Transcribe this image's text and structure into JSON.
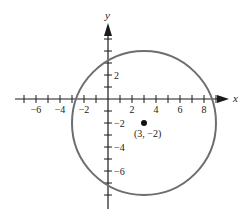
{
  "diagram": {
    "type": "coordinate-plane-circle",
    "axes": {
      "x_label": "x",
      "y_label": "y",
      "x_range": [
        -7,
        9
      ],
      "y_range": [
        -8,
        5
      ],
      "x_tick_labels": [
        {
          "value": -6,
          "text": "−6"
        },
        {
          "value": -4,
          "text": "−4"
        },
        {
          "value": -2,
          "text": "−2"
        },
        {
          "value": 2,
          "text": "2"
        },
        {
          "value": 4,
          "text": "4"
        },
        {
          "value": 6,
          "text": "6"
        },
        {
          "value": 8,
          "text": "8"
        }
      ],
      "y_tick_labels": [
        {
          "value": 2,
          "text": "2"
        },
        {
          "value": -2,
          "text": "−2"
        },
        {
          "value": -4,
          "text": "−4"
        },
        {
          "value": -6,
          "text": "−6"
        }
      ]
    },
    "circle": {
      "center": [
        3,
        -2
      ],
      "radius": 6,
      "stroke_color": "#6e6e6e"
    },
    "center_point": {
      "x": 3,
      "y": -2,
      "label": "(3, −2)",
      "color": "#111111"
    },
    "colors": {
      "axis": "#1a1a1a",
      "background": "#ffffff"
    }
  }
}
